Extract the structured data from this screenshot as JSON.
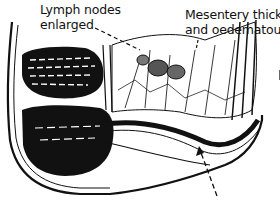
{
  "figure": {
    "labels": {
      "lymph_nodes": [
        "Lymph nodes",
        "enlarged"
      ],
      "mesentery": [
        "Mesentery thick",
        "and oedematous"
      ]
    },
    "arrows": [
      {
        "from_label": "lymph_nodes",
        "style": "dashed",
        "points_to": "mesenteric lymph nodes"
      },
      {
        "from_label": "mesentery",
        "style": "dashed",
        "points_to": "mesentery"
      },
      {
        "from_label": "unlabeled (bottom)",
        "style": "dashed",
        "points_to": "thickened bowel wall"
      }
    ],
    "colors": {
      "ink": "#111111",
      "background": "#ffffff"
    }
  }
}
